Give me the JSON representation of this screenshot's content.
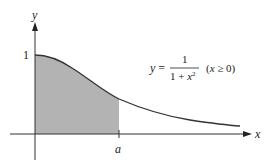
{
  "diagram": {
    "type": "function-graph",
    "axes": {
      "x_label": "x",
      "y_label": "y",
      "y_tick_label": "1",
      "x_tick_label": "a"
    },
    "equation": {
      "lhs": "y =",
      "numerator": "1",
      "denominator_base": "1 + x",
      "denominator_exp": "2",
      "domain": "(x ≥ 0)"
    },
    "shaded_region": {
      "from": 0,
      "to": "a",
      "color": "#b3b3b3"
    },
    "colors": {
      "axis": "#333333",
      "curve": "#333333",
      "shade": "#b3b3b3"
    }
  }
}
